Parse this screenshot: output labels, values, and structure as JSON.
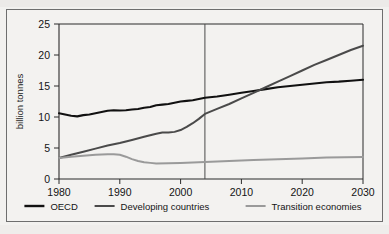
{
  "chart_data": {
    "type": "line",
    "title": "",
    "xlabel": "",
    "ylabel": "billion tonnes",
    "xlim": [
      1980,
      2030
    ],
    "ylim": [
      0,
      25
    ],
    "xticks": [
      1980,
      1990,
      2000,
      2010,
      2020,
      2030
    ],
    "yticks": [
      0,
      5,
      10,
      15,
      20,
      25
    ],
    "grid": false,
    "legend_position": "bottom",
    "annotations": [
      {
        "type": "vertical-line",
        "name": "projection-divider",
        "x": 2004,
        "label": ""
      }
    ],
    "series": [
      {
        "name": "OECD",
        "color": "#111111",
        "width": 2.1,
        "x": [
          1980,
          1981,
          1982,
          1983,
          1984,
          1985,
          1986,
          1987,
          1988,
          1989,
          1990,
          1991,
          1992,
          1993,
          1994,
          1995,
          1996,
          1997,
          1998,
          1999,
          2000,
          2001,
          2002,
          2003,
          2004,
          2006,
          2008,
          2010,
          2012,
          2014,
          2016,
          2018,
          2020,
          2022,
          2024,
          2026,
          2028,
          2030
        ],
        "values": [
          10.6,
          10.4,
          10.2,
          10.1,
          10.3,
          10.4,
          10.6,
          10.8,
          11.0,
          11.1,
          11.05,
          11.1,
          11.2,
          11.3,
          11.5,
          11.6,
          11.9,
          12.0,
          12.1,
          12.3,
          12.5,
          12.6,
          12.7,
          12.9,
          13.1,
          13.3,
          13.6,
          13.9,
          14.2,
          14.5,
          14.8,
          15.0,
          15.2,
          15.4,
          15.6,
          15.7,
          15.85,
          16.0
        ]
      },
      {
        "name": "Developing countries",
        "color": "#4a4a4a",
        "width": 2.0,
        "x": [
          1980,
          1982,
          1984,
          1986,
          1988,
          1990,
          1992,
          1994,
          1996,
          1997,
          1998,
          1999,
          2000,
          2001,
          2002,
          2003,
          2004,
          2006,
          2008,
          2010,
          2012,
          2014,
          2016,
          2018,
          2020,
          2022,
          2024,
          2026,
          2028,
          2030
        ],
        "values": [
          3.4,
          3.9,
          4.4,
          4.9,
          5.4,
          5.8,
          6.3,
          6.8,
          7.3,
          7.5,
          7.5,
          7.6,
          7.9,
          8.4,
          9.0,
          9.7,
          10.5,
          11.3,
          12.1,
          13.0,
          13.9,
          14.8,
          15.7,
          16.6,
          17.5,
          18.4,
          19.2,
          20.0,
          20.8,
          21.5
        ]
      },
      {
        "name": "Transition economies",
        "color": "#9a9a9a",
        "width": 2.0,
        "x": [
          1980,
          1982,
          1984,
          1986,
          1988,
          1989,
          1990,
          1991,
          1992,
          1993,
          1994,
          1995,
          1996,
          1998,
          2000,
          2004,
          2008,
          2012,
          2016,
          2020,
          2024,
          2027,
          2030
        ],
        "values": [
          3.4,
          3.6,
          3.75,
          3.9,
          4.0,
          4.0,
          3.9,
          3.6,
          3.2,
          2.9,
          2.7,
          2.6,
          2.5,
          2.55,
          2.6,
          2.75,
          2.9,
          3.05,
          3.2,
          3.3,
          3.45,
          3.5,
          3.55
        ]
      }
    ]
  },
  "legend": {
    "items": [
      {
        "label": "OECD",
        "color": "#111111"
      },
      {
        "label": "Developing countries",
        "color": "#4a4a4a"
      },
      {
        "label": "Transition economies",
        "color": "#9a9a9a"
      }
    ]
  },
  "axes": {
    "y_title": "billion tonnes",
    "y_tick_labels": [
      "25",
      "20",
      "15",
      "10",
      "5",
      "0"
    ],
    "x_tick_labels": [
      "1980",
      "1990",
      "2000",
      "2010",
      "2020",
      "2030"
    ]
  }
}
